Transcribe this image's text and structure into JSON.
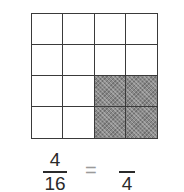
{
  "diagram": {
    "type": "fraction-grid",
    "grid": {
      "rows": 4,
      "cols": 4,
      "shaded_cells": [
        [
          2,
          2
        ],
        [
          2,
          3
        ],
        [
          3,
          2
        ],
        [
          3,
          3
        ]
      ],
      "shade_color": "#8a8a8a",
      "line_color": "#3a3a3a"
    },
    "equation": {
      "left_fraction": {
        "numerator": "4",
        "denominator": "16"
      },
      "operator": "=",
      "right_fraction": {
        "numerator": "",
        "denominator": "4"
      }
    }
  }
}
